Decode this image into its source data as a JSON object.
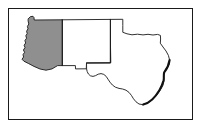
{
  "figure": {
    "background_color": "#ffffff",
    "frame": {
      "name": "map-border-frame",
      "stroke_color": "#1a1a1a",
      "stroke_width_px": 1,
      "x": 8,
      "y": 8,
      "width": 185,
      "height": 112
    },
    "width_px": 202,
    "height_px": 129
  },
  "map": {
    "projection_note": "unprojected schematic outline",
    "line_color": "#1a1a1a",
    "line_width_px": 0.9,
    "coastline_color": "#111111",
    "coastline_width_px": 2.1,
    "highlight_fill": "#8f8f8f",
    "plain_fill": "#ffffff",
    "states": [
      {
        "id": "arizona",
        "name": "Arizona",
        "abbr": "AZ",
        "highlighted": true,
        "fill": "#8f8f8f",
        "outline": "M 28.4 18.6 L 30.5 16.6 L 33.0 16.3 L 34.0 17.6 L 34.2 20.0 L 62.3 19.8 L 62.3 36.0 L 62.3 52.0 L 62.3 65.6 L 57.6 65.6 L 52.0 68.9 L 46.0 70.2 L 40.0 69.0 L 34.0 66.4 L 28.3 63.4 L 23.9 61.2 L 22.0 59.2 L 23.6 57.0 L 23.0 54.7 L 24.6 52.3 L 23.4 50.0 L 25.0 47.6 L 24.1 45.2 L 25.7 43.0 L 24.9 40.6 L 26.6 38.2 L 25.8 35.8 L 27.2 33.6 L 26.6 31.2 L 28.0 28.8 L 27.4 26.4 L 28.8 24.0 L 28.2 21.4 Z"
      },
      {
        "id": "new-mexico",
        "name": "New Mexico",
        "abbr": "NM",
        "highlighted": false,
        "fill": "#ffffff",
        "outline": "M 62.3 19.8 L 110.4 19.4 L 110.4 35.0 L 110.4 50.0 L 110.4 62.8 L 86.5 62.9 L 86.3 68.8 L 75.5 68.9 L 75.4 65.6 L 62.3 65.6 Z"
      },
      {
        "id": "texas",
        "name": "Texas",
        "abbr": "TX",
        "highlighted": false,
        "fill": "#ffffff",
        "outline": "M 110.4 19.4 L 122.8 19.3 L 122.8 25.6 L 122.8 32.3 L 127.0 33.8 L 132.0 34.8 L 137.5 34.2 L 143.0 34.9 L 148.0 34.3 L 153.0 35.0 L 157.6 34.4 L 160.4 35.4 L 160.6 39.0 L 160.3 43.2 L 163.0 47.0 L 166.0 51.0 L 168.4 55.4 L 169.6 60.0 L 169.0 64.6 L 167.0 68.6 L 164.2 72.4 L 163.6 76.6 L 164.0 81.0 L 163.0 85.2 L 161.0 89.0 L 158.6 92.6 L 156.0 96.0 L 153.0 99.0 L 149.5 101.6 L 146.0 103.4 L 142.5 104.6 L 139.0 104.0 L 136.0 101.8 L 133.5 98.8 L 131.4 95.4 L 129.0 92.4 L 126.0 90.2 L 122.6 89.0 L 119.0 88.4 L 115.4 87.2 L 112.4 85.0 L 110.0 82.2 L 108.0 79.2 L 106.2 76.4 L 103.8 74.4 L 101.0 73.6 L 98.2 74.2 L 95.6 75.6 L 93.0 76.4 L 90.4 75.8 L 88.4 74.0 L 87.2 71.6 L 86.6 69.0 L 86.5 62.9 L 110.4 62.8 Z",
        "coastline": "M 169.6 60.0 C 169.0 64.6 167.2 68.4 164.2 72.4 C 163.4 75.0 164.2 77.4 163.6 80.2 C 162.6 83.8 161.2 87.0 159.4 90.2 C 157.4 93.6 155.0 96.8 152.2 99.4 C 149.6 101.8 146.6 103.6 143.2 104.6"
      }
    ],
    "internal_borders": [
      {
        "id": "az-nm-border",
        "name": "arizona-new-mexico-border",
        "path": "M 62.3 19.8 L 62.3 65.6"
      },
      {
        "id": "nm-tx-border",
        "name": "new-mexico-texas-border",
        "path": "M 110.4 19.4 L 110.4 62.8 L 86.5 62.9"
      }
    ]
  },
  "legend": {
    "highlighted_state_label": "Arizona",
    "highlighted_state_fill": "#8f8f8f"
  }
}
